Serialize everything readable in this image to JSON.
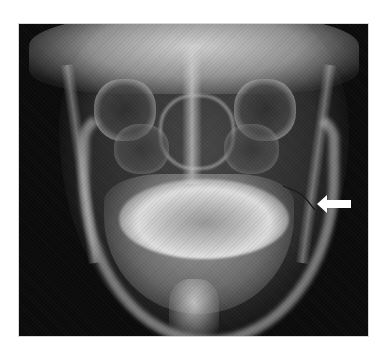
{
  "image": {
    "type": "radiograph",
    "view": "posteroanterior skull / mandible",
    "description": "Grayscale X-ray of the facial skeleton and mandible with a white arrow pointing left at a fracture line on the right side of the image (mandibular angle region)."
  },
  "annotations": [
    {
      "kind": "arrow",
      "direction": "left",
      "color": "#ffffff",
      "target": "fracture-line"
    }
  ],
  "colors": {
    "background": "#ffffff",
    "film": "#0b0b0b",
    "bone": "#d8d8d8",
    "arrow": "#ffffff"
  }
}
